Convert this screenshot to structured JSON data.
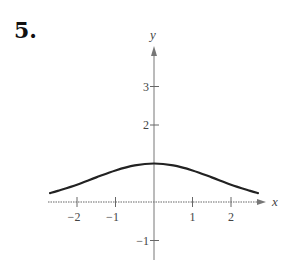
{
  "problem": {
    "number": "5."
  },
  "chart_data": {
    "type": "line",
    "title": "",
    "xlabel": "x",
    "ylabel": "y",
    "xlim": [
      -2.7,
      2.9
    ],
    "ylim": [
      -1.5,
      4
    ],
    "grid": false,
    "x_ticks": [
      -2,
      -1,
      1,
      2
    ],
    "x_tick_labels": [
      "−2",
      "−1",
      "1",
      "2"
    ],
    "y_ticks": [
      3,
      2,
      -1
    ],
    "y_tick_labels": [
      "3",
      "2",
      "−1"
    ],
    "series": [
      {
        "name": "curve",
        "color": "#222222",
        "x": [
          -2.7,
          -2.5,
          -2,
          -1.5,
          -1,
          -0.5,
          0,
          0.5,
          1,
          1.5,
          2,
          2.5,
          2.7
        ],
        "y": [
          0.23,
          0.29,
          0.45,
          0.64,
          0.82,
          0.95,
          1.0,
          0.95,
          0.82,
          0.64,
          0.45,
          0.29,
          0.23
        ]
      }
    ]
  }
}
